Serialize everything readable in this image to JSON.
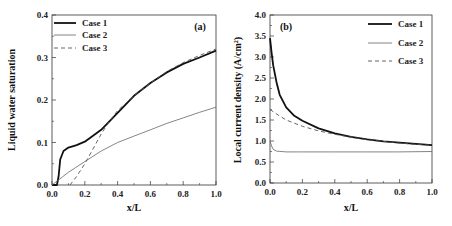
{
  "chart_data": [
    {
      "type": "line",
      "panel_label": "(a)",
      "xlabel": "x/L",
      "ylabel": "Liquid water saturation",
      "xlim": [
        0.0,
        1.0
      ],
      "ylim": [
        0.0,
        0.4
      ],
      "xticks": [
        "0.0",
        "0.2",
        "0.4",
        "0.6",
        "0.8",
        "1.0"
      ],
      "yticks": [
        "0.0",
        "0.1",
        "0.2",
        "0.3",
        "0.4"
      ],
      "grid": false,
      "legend_position": "upper-left",
      "series": [
        {
          "name": "Case 1",
          "style": "solid-thick",
          "x": [
            0.0,
            0.03,
            0.04,
            0.05,
            0.07,
            0.1,
            0.15,
            0.2,
            0.3,
            0.4,
            0.5,
            0.6,
            0.7,
            0.8,
            0.9,
            1.0
          ],
          "y": [
            0.0,
            0.0,
            0.02,
            0.06,
            0.08,
            0.088,
            0.094,
            0.102,
            0.13,
            0.17,
            0.21,
            0.24,
            0.265,
            0.285,
            0.3,
            0.316
          ]
        },
        {
          "name": "Case 2",
          "style": "solid-thin",
          "x": [
            0.0,
            0.1,
            0.2,
            0.3,
            0.4,
            0.5,
            0.6,
            0.7,
            0.8,
            0.9,
            1.0
          ],
          "y": [
            0.0,
            0.03,
            0.055,
            0.08,
            0.1,
            0.115,
            0.13,
            0.145,
            0.158,
            0.171,
            0.183
          ]
        },
        {
          "name": "Case 3",
          "style": "dashed",
          "x": [
            0.11,
            0.15,
            0.2,
            0.25,
            0.3,
            0.35,
            0.4,
            0.5,
            0.6,
            0.7,
            0.8,
            0.9,
            1.0
          ],
          "y": [
            0.0,
            0.02,
            0.05,
            0.085,
            0.12,
            0.15,
            0.175,
            0.21,
            0.24,
            0.267,
            0.288,
            0.305,
            0.32
          ]
        }
      ]
    },
    {
      "type": "line",
      "panel_label": "(b)",
      "xlabel": "x/L",
      "ylabel": "Local current density (A/cm²)",
      "xlim": [
        0.0,
        1.0
      ],
      "ylim": [
        0.0,
        4.0
      ],
      "xticks": [
        "0.0",
        "0.2",
        "0.4",
        "0.6",
        "0.8",
        "1.0"
      ],
      "yticks": [
        "0.0",
        "0.5",
        "1.0",
        "1.5",
        "2.0",
        "2.5",
        "3.0",
        "3.5",
        "4.0"
      ],
      "grid": false,
      "legend_position": "upper-right",
      "series": [
        {
          "name": "Case 1",
          "style": "solid-thick",
          "x": [
            0.0,
            0.01,
            0.02,
            0.04,
            0.06,
            0.1,
            0.15,
            0.2,
            0.3,
            0.4,
            0.5,
            0.6,
            0.7,
            0.8,
            0.9,
            1.0
          ],
          "y": [
            3.45,
            3.1,
            2.8,
            2.4,
            2.1,
            1.8,
            1.6,
            1.48,
            1.3,
            1.18,
            1.1,
            1.04,
            0.99,
            0.96,
            0.93,
            0.9
          ]
        },
        {
          "name": "Case 2",
          "style": "solid-thin",
          "x": [
            0.0,
            0.01,
            0.02,
            0.04,
            0.1,
            0.2,
            0.4,
            0.6,
            0.8,
            1.0
          ],
          "y": [
            1.0,
            0.88,
            0.8,
            0.76,
            0.74,
            0.74,
            0.74,
            0.74,
            0.74,
            0.75
          ]
        },
        {
          "name": "Case 3",
          "style": "dashed",
          "x": [
            0.0,
            0.05,
            0.1,
            0.2,
            0.3,
            0.4,
            0.5,
            0.6,
            0.7,
            0.8,
            0.9,
            1.0
          ],
          "y": [
            1.75,
            1.62,
            1.5,
            1.35,
            1.24,
            1.16,
            1.09,
            1.03,
            0.99,
            0.95,
            0.92,
            0.9
          ]
        }
      ]
    }
  ],
  "legend": {
    "case1": "Case 1",
    "case2": "Case 2",
    "case3": "Case 3"
  }
}
